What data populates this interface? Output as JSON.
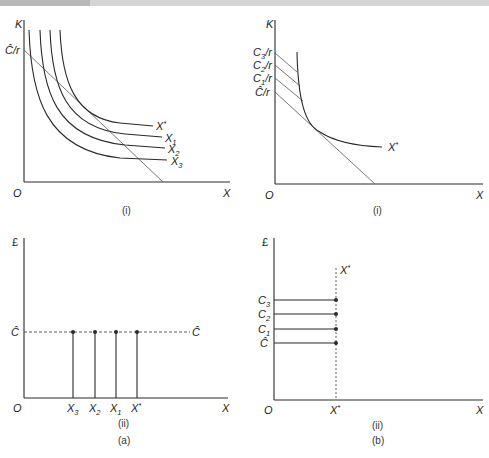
{
  "figure": {
    "caption_a": "(a)",
    "caption_b": "(b)"
  },
  "panels": {
    "a_i": {
      "sub_caption": "(i)",
      "y_axis_label": "K",
      "x_axis_label": "X",
      "origin_label": "O",
      "intercept_label": "Ĉ/r",
      "curves": [
        {
          "name": "X*",
          "base": "X",
          "sup": "*"
        },
        {
          "name": "X1",
          "base": "X",
          "sub": "1"
        },
        {
          "name": "X2",
          "base": "X",
          "sub": "2"
        },
        {
          "name": "X3",
          "base": "X",
          "sub": "3"
        }
      ]
    },
    "b_i": {
      "sub_caption": "(i)",
      "y_axis_label": "K",
      "x_axis_label": "X",
      "origin_label": "O",
      "intercepts": [
        {
          "name": "C3/r",
          "base": "C",
          "sub": "3",
          "tail": "/r"
        },
        {
          "name": "C2/r",
          "base": "C",
          "sub": "2",
          "tail": "/r"
        },
        {
          "name": "C1/r",
          "base": "C",
          "sub": "1",
          "tail": "/r"
        },
        {
          "name": "Ĉ/r",
          "base": "Ĉ",
          "sub": "",
          "tail": "/r"
        }
      ],
      "curve_label": {
        "base": "X",
        "sup": "*"
      }
    },
    "a_ii": {
      "sub_caption": "(ii)",
      "y_axis_label": "£",
      "x_axis_label": "X",
      "origin_label": "O",
      "cost_level_left": "Ĉ",
      "cost_level_right": "Ĉ",
      "x_ticks": [
        {
          "base": "X",
          "sub": "3"
        },
        {
          "base": "X",
          "sub": "2"
        },
        {
          "base": "X",
          "sub": "1"
        },
        {
          "base": "X",
          "sup": "*"
        }
      ]
    },
    "b_ii": {
      "sub_caption": "(ii)",
      "y_axis_label": "£",
      "x_axis_label": "X",
      "origin_label": "O",
      "vertical_line_label": {
        "base": "X",
        "sup": "*"
      },
      "x_tick": {
        "base": "X",
        "sup": "*"
      },
      "cost_levels": [
        {
          "base": "C",
          "sub": "3"
        },
        {
          "base": "C",
          "sub": "2"
        },
        {
          "base": "C",
          "sub": "1"
        },
        {
          "base": "Ĉ",
          "sub": ""
        }
      ]
    }
  },
  "colors": {
    "line": "#2a2a2a",
    "thin_line": "#555555",
    "topbar": "#d4d4d4"
  }
}
